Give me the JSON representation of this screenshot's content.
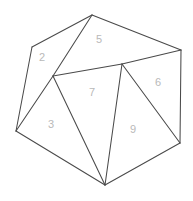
{
  "figure": {
    "kind": "polygon-subdivision-diagram",
    "width": 193,
    "height": 201,
    "background_color": "#ffffff",
    "stroke_color": "#4a4a4a",
    "label_color": "#b9b9b9",
    "stroke_width": 1.05,
    "label_font_size": 11
  },
  "vertices": [
    {
      "id": "apex",
      "name": "top-vertex",
      "x": 92,
      "y": 15
    },
    {
      "id": "upper_left",
      "name": "upper-left-vertex",
      "x": 32,
      "y": 47
    },
    {
      "id": "left",
      "name": "left-vertex",
      "x": 16,
      "y": 131
    },
    {
      "id": "bottom",
      "name": "bottom-vertex",
      "x": 105,
      "y": 185
    },
    {
      "id": "lower_right",
      "name": "lower-right-vertex",
      "x": 180,
      "y": 143
    },
    {
      "id": "upper_right",
      "name": "upper-right-vertex",
      "x": 181,
      "y": 50
    },
    {
      "id": "junction",
      "name": "interior-junction",
      "x": 53,
      "y": 76
    },
    {
      "id": "mid_top",
      "name": "interior-mid-vertex",
      "x": 122,
      "y": 64
    }
  ],
  "regions": [
    {
      "label": "2",
      "name": "region-2",
      "points": "32,47 92,15 53,76 16,131",
      "label_x": 42,
      "label_y": 58
    },
    {
      "label": "5",
      "name": "region-5",
      "points": "92,15 181,50 122,64 53,76",
      "label_x": 99,
      "label_y": 40
    },
    {
      "label": "6",
      "name": "region-6",
      "points": "122,64 181,50 180,143",
      "label_x": 158,
      "label_y": 83
    },
    {
      "label": "7",
      "name": "region-7",
      "points": "53,76 122,64 105,185",
      "label_x": 92,
      "label_y": 93
    },
    {
      "label": "3",
      "name": "region-3",
      "points": "16,131 53,76 105,185",
      "label_x": 51,
      "label_y": 125
    },
    {
      "label": "9",
      "name": "region-9",
      "points": "122,64 180,143 105,185",
      "label_x": 133,
      "label_y": 130
    }
  ],
  "edges": [
    {
      "name": "outer-edge-apex-upperleft",
      "x1": 92,
      "y1": 15,
      "x2": 32,
      "y2": 47
    },
    {
      "name": "outer-edge-upperleft-left",
      "x1": 32,
      "y1": 47,
      "x2": 16,
      "y2": 131
    },
    {
      "name": "outer-edge-left-bottom",
      "x1": 16,
      "y1": 131,
      "x2": 105,
      "y2": 185
    },
    {
      "name": "outer-edge-bottom-lowerright",
      "x1": 105,
      "y1": 185,
      "x2": 180,
      "y2": 143
    },
    {
      "name": "outer-edge-lowerright-upperright",
      "x1": 180,
      "y1": 143,
      "x2": 181,
      "y2": 50
    },
    {
      "name": "outer-edge-upperright-apex",
      "x1": 181,
      "y1": 50,
      "x2": 92,
      "y2": 15
    },
    {
      "name": "inner-edge-apex-junction",
      "x1": 92,
      "y1": 15,
      "x2": 53,
      "y2": 76
    },
    {
      "name": "inner-edge-left-junction",
      "x1": 16,
      "y1": 131,
      "x2": 53,
      "y2": 76
    },
    {
      "name": "inner-edge-junction-midtop",
      "x1": 53,
      "y1": 76,
      "x2": 122,
      "y2": 64
    },
    {
      "name": "inner-edge-midtop-upperright",
      "x1": 122,
      "y1": 64,
      "x2": 181,
      "y2": 50
    },
    {
      "name": "inner-edge-junction-bottom",
      "x1": 53,
      "y1": 76,
      "x2": 105,
      "y2": 185
    },
    {
      "name": "inner-edge-midtop-bottom",
      "x1": 122,
      "y1": 64,
      "x2": 105,
      "y2": 185
    },
    {
      "name": "inner-edge-midtop-lowerright",
      "x1": 122,
      "y1": 64,
      "x2": 180,
      "y2": 143
    }
  ]
}
